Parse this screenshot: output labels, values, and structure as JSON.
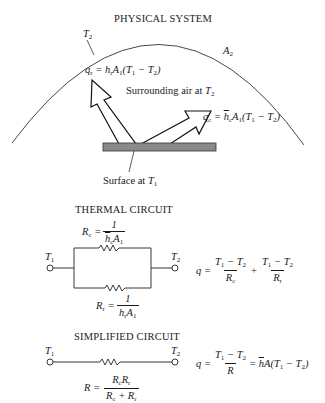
{
  "physical_system": {
    "title": "PHYSICAL SYSTEM",
    "enclosure_temp_label": "T2",
    "enclosure_area_label": "A2",
    "radiation_equation": "q_r = h_r A_1 (T_1 − T_2)",
    "convection_equation": "q_c = h̄_c A_1 (T_1 − T_2)",
    "surrounding_label": "Surrounding air at T2",
    "surface_label": "Surface at T1",
    "surface_color": "#8a8a8a"
  },
  "thermal_circuit": {
    "title": "THERMAL CIRCUIT",
    "node_left": "T1",
    "node_right": "T2",
    "Rc_label": "R_c = 1 / (h̄_c A_1)",
    "Rr_label": "R_r = 1 / (h_r A_1)",
    "equation": "q = (T1 − T2)/R_c + (T1 − T2)/R_r"
  },
  "simplified_circuit": {
    "title": "SIMPLIFIED CIRCUIT",
    "node_left": "T1",
    "node_right": "T2",
    "R_label": "R = R_c R_r / (R_c + R_r)",
    "equation": "q = (T1 − T2)/R = h̄ A (T1 − T2)"
  }
}
